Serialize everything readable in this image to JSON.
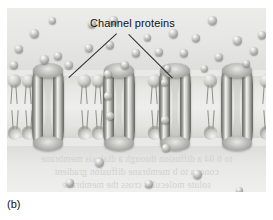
{
  "figure": {
    "panel_letter": "(b)",
    "label": "Channel proteins",
    "style": "grayscale textbook illustration",
    "colors": {
      "background": "#ffffff",
      "panel_fill": "#e9e9e7",
      "membrane_core": "#eeeeec",
      "particle_gray": "#a3a39e",
      "protein_dark": "#6e6e69",
      "protein_highlight": "#f2f2f0",
      "label_text": "#121212",
      "leader_line": "#2b2b2b",
      "ghost_text": "#d2d2cf"
    }
  },
  "ghost_text": {
    "line1": "to 6 04 a diffusion through a dialysis membrane",
    "line2": "conc. a to b membrane diffusion gradient",
    "line3": "solute molecules cross the membrane"
  },
  "membrane": {
    "name": "phospholipid-bilayer",
    "leaflets": 2,
    "lipid_count_per_leaflet": 24,
    "channel_protein_count": 4,
    "channel_x_positions": [
      25,
      96,
      152,
      214
    ]
  },
  "regions": {
    "top": {
      "name": "extracellular-fluid",
      "concentration": "high",
      "particle_count": 26
    },
    "bottom": {
      "name": "intracellular-fluid",
      "concentration": "low",
      "particle_count": 6
    }
  },
  "particles_top": [
    {
      "x": 27,
      "y": 25,
      "r": 9
    },
    {
      "x": 106,
      "y": 12,
      "r": 9
    },
    {
      "x": 205,
      "y": 12,
      "r": 9
    },
    {
      "x": 37,
      "y": 51,
      "r": 9
    },
    {
      "x": 103,
      "y": 37,
      "r": 8
    },
    {
      "x": 166,
      "y": 25,
      "r": 9
    },
    {
      "x": 12,
      "y": 41,
      "r": 8
    },
    {
      "x": 82,
      "y": 40,
      "r": 8
    },
    {
      "x": 189,
      "y": 30,
      "r": 8
    },
    {
      "x": 230,
      "y": 32,
      "r": 9
    },
    {
      "x": 51,
      "y": 48,
      "r": 8
    },
    {
      "x": 129,
      "y": 45,
      "r": 8
    },
    {
      "x": 152,
      "y": 44,
      "r": 8
    },
    {
      "x": 177,
      "y": 45,
      "r": 8
    },
    {
      "x": 247,
      "y": 43,
      "r": 8
    },
    {
      "x": 7,
      "y": 57,
      "r": 8
    },
    {
      "x": 62,
      "y": 57,
      "r": 8
    },
    {
      "x": 118,
      "y": 57,
      "r": 8
    },
    {
      "x": 212,
      "y": 49,
      "r": 8
    },
    {
      "x": 239,
      "y": 55,
      "r": 7
    },
    {
      "x": 140,
      "y": 29,
      "r": 7
    },
    {
      "x": 85,
      "y": 16,
      "r": 8
    },
    {
      "x": 255,
      "y": 27,
      "r": 8
    },
    {
      "x": 197,
      "y": 60,
      "r": 7
    },
    {
      "x": 160,
      "y": 60,
      "r": 7
    },
    {
      "x": 45,
      "y": 12,
      "r": 7
    }
  ],
  "particles_in_channel": [
    {
      "x": 101,
      "y": 66,
      "r": 8
    },
    {
      "x": 101,
      "y": 88,
      "r": 8
    },
    {
      "x": 103,
      "y": 108,
      "r": 8
    },
    {
      "x": 157,
      "y": 74,
      "r": 7
    },
    {
      "x": 158,
      "y": 112,
      "r": 8
    }
  ],
  "particles_bottom": [
    {
      "x": 159,
      "y": 140,
      "r": 8
    },
    {
      "x": 92,
      "y": 154,
      "r": 9
    },
    {
      "x": 190,
      "y": 166,
      "r": 9
    },
    {
      "x": 63,
      "y": 175,
      "r": 8
    },
    {
      "x": 142,
      "y": 176,
      "r": 8
    },
    {
      "x": 232,
      "y": 182,
      "r": 7
    }
  ],
  "leaders": [
    {
      "name": "leader-left",
      "from_x": 110,
      "from_y": 26,
      "to_x": 62,
      "to_y": 70
    },
    {
      "name": "leader-right",
      "from_x": 122,
      "from_y": 26,
      "to_x": 166,
      "to_y": 70
    }
  ]
}
